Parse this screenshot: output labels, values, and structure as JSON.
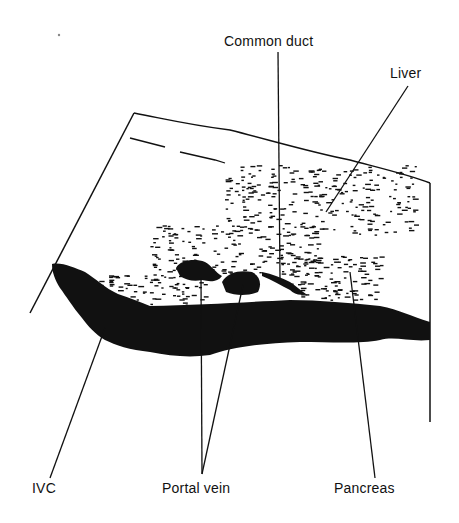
{
  "diagram": {
    "type": "anatomical-ultrasound-sketch",
    "labels": {
      "common_duct": "Common duct",
      "liver": "Liver",
      "ivc": "IVC",
      "portal_vein": "Portal vein",
      "pancreas": "Pancreas"
    },
    "colors": {
      "ink": "#111111",
      "background": "#ffffff"
    }
  }
}
